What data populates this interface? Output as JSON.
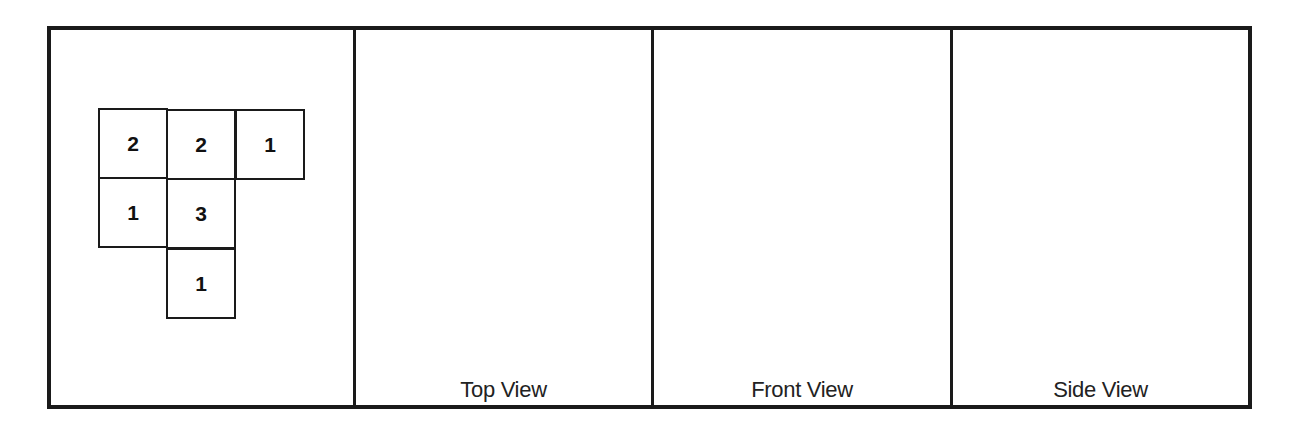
{
  "diagram": {
    "type": "isometric-views-worksheet",
    "mat_plan": {
      "cells": [
        {
          "row": 0,
          "col": 0,
          "value": "2"
        },
        {
          "row": 0,
          "col": 1,
          "value": "2"
        },
        {
          "row": 0,
          "col": 2,
          "value": "1"
        },
        {
          "row": 1,
          "col": 0,
          "value": "1"
        },
        {
          "row": 1,
          "col": 1,
          "value": "3"
        },
        {
          "row": 2,
          "col": 1,
          "value": "1"
        }
      ]
    },
    "panels": [
      {
        "label": ""
      },
      {
        "label": "Top View"
      },
      {
        "label": "Front View"
      },
      {
        "label": "Side View"
      }
    ],
    "colors": {
      "line": "#1a1a1a",
      "background": "#ffffff"
    }
  }
}
